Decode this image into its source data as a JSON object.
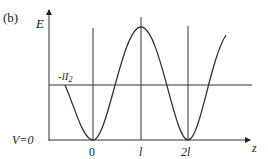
{
  "panel_label": "(b)",
  "axes": {
    "y_label": "E",
    "x_label": "z",
    "baseline_label": "V=0",
    "level_label": "-lI",
    "level_label_sub": "2"
  },
  "x_ticks": [
    {
      "label": "0"
    },
    {
      "label": "l"
    },
    {
      "label": "2l"
    }
  ],
  "colors": {
    "line": "#333333",
    "curve": "#333333"
  }
}
